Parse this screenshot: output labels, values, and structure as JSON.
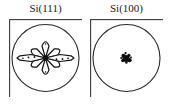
{
  "figure": {
    "background_color": "#ffffff",
    "line_color": "#1a1a1a",
    "panel_count": 2
  },
  "panels": [
    {
      "id": "si111",
      "title": "Si(111)",
      "frame_shape": "square",
      "projection_circle": "inscribed-circle",
      "pattern_name": "six-fold-petal-star",
      "pattern_description": "six petal lobes in hexagonal arrangement with two elongated horizontal arrow lobes",
      "petal_count": 6,
      "has_horizontal_lobes": true,
      "petal_angles_deg": [
        30,
        90,
        150,
        210,
        270,
        330
      ],
      "horizontal_lobe_angles_deg": [
        0,
        180
      ],
      "petal_radius_px": 17,
      "horizontal_lobe_radius_px": 27,
      "center_x_px": 36.5,
      "center_y_px": 39
    },
    {
      "id": "si100",
      "title": "Si(100)",
      "frame_shape": "square",
      "projection_circle": "inscribed-circle",
      "pattern_name": "central-cluster-blob",
      "pattern_description": "small compact dark cluster of dots at the center of the projection circle",
      "petal_count": 0,
      "has_horizontal_lobes": false,
      "blob_radius_px": 5,
      "center_x_px": 36.5,
      "center_y_px": 39
    }
  ]
}
